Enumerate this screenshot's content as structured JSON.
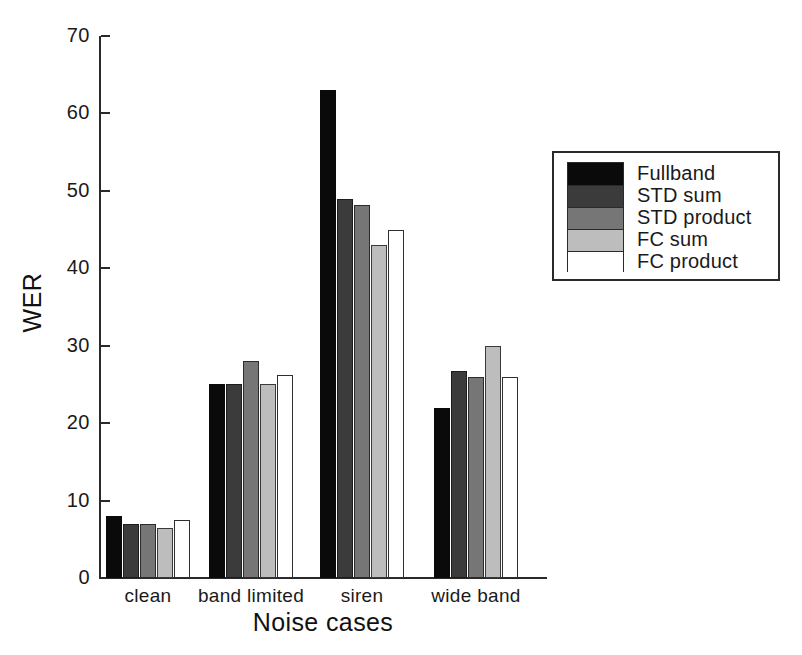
{
  "chart_data": {
    "type": "bar",
    "title": "",
    "xlabel": "Noise cases",
    "ylabel": "WER",
    "ylim": [
      0,
      70
    ],
    "yticks": [
      0,
      10,
      20,
      30,
      40,
      50,
      60,
      70
    ],
    "grid": false,
    "legend_position": "right",
    "categories": [
      "clean",
      "band limited",
      "siren",
      "wide band"
    ],
    "series": [
      {
        "name": "Fullband",
        "color": "#0a0a0a",
        "values": [
          8.0,
          25.0,
          63.0,
          22.0
        ]
      },
      {
        "name": "STD sum",
        "color": "#3b3b3b",
        "values": [
          7.0,
          25.0,
          49.0,
          26.8
        ]
      },
      {
        "name": "STD product",
        "color": "#767676",
        "values": [
          7.0,
          28.0,
          48.2,
          26.0
        ]
      },
      {
        "name": "FC sum",
        "color": "#bdbdbd",
        "values": [
          6.5,
          25.0,
          43.0,
          30.0
        ]
      },
      {
        "name": "FC product",
        "color": "#ffffff",
        "values": [
          7.5,
          26.2,
          45.0,
          26.0
        ]
      }
    ]
  },
  "axes": {
    "y_title": "WER",
    "x_title": "Noise cases",
    "y_tick_labels": [
      "70",
      "60",
      "50",
      "40",
      "30",
      "20",
      "10",
      "0"
    ],
    "x_group_labels": [
      "clean",
      "band limited",
      "siren",
      "wide band"
    ]
  },
  "legend": {
    "entries": [
      {
        "label": "Fullband",
        "swatch": "black-swatch"
      },
      {
        "label": "STD sum",
        "swatch": "dark-gray-swatch"
      },
      {
        "label": "STD product",
        "swatch": "medium-gray-swatch"
      },
      {
        "label": "FC sum",
        "swatch": "light-gray-swatch"
      },
      {
        "label": "FC product",
        "swatch": "white-swatch"
      }
    ]
  },
  "colors": {
    "series_0": "#0a0a0a",
    "series_1": "#3b3b3b",
    "series_2": "#767676",
    "series_3": "#bdbdbd",
    "series_4": "#ffffff",
    "axis": "#2a2a2a",
    "background": "#ffffff"
  }
}
